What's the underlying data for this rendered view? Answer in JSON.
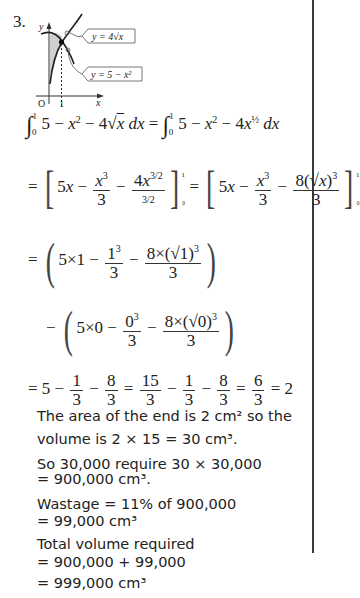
{
  "question": {
    "number": "3.",
    "diagram": {
      "curve1_label": "y = 4√x",
      "curve2_label": "y = 5 − x²",
      "x_axis_label": "x",
      "y_axis_label": "y",
      "origin_label": "O",
      "x_tick_label": "1"
    },
    "working": {
      "line1_left": "∫₀¹ 5 − x² − 4√x dx",
      "line1_right": "∫₀¹ 5 − x² − 4x^(1/2) dx",
      "line2": "= [5x − x³/3 − 4x^(3/2)/(3/2)]₀¹ = [5x − x³/3 − 8(√x)³/3]₀¹",
      "line3": "= (5×1 − 1³/3 − 8×(√1)³/3)",
      "line4": "− (5×0 − 0³/3 − 8×(√0)³/3)",
      "line5": "= 5 − 1/3 − 8/3 = 15/3 − 1/3 − 8/3 = 6/3 = 2"
    },
    "text_lines": [
      "The area of the end is 2 cm² so the",
      "volume is 2 × 15 = 30 cm³.",
      "So 30,000 require 30 × 30,000",
      "= 900,000 cm³.",
      "Wastage = 11% of 900,000",
      "= 99,000 cm³",
      "Total volume required",
      "= 900,000 + 99,000",
      "= 999,000 cm³"
    ]
  }
}
